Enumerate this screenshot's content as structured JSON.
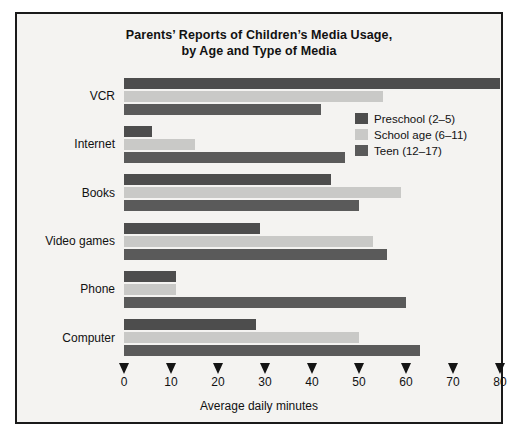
{
  "chart_data": {
    "type": "bar",
    "orientation": "horizontal",
    "title": "Parents’ Reports of Children’s Media Usage,",
    "title_line2": "by Age and Type of Media",
    "xlabel": "Average daily minutes",
    "ylabel": "",
    "xlim": [
      0,
      80
    ],
    "xticks": [
      0,
      10,
      20,
      30,
      40,
      50,
      60,
      70,
      80
    ],
    "xtick_labels": [
      "0",
      "10",
      "20",
      "30",
      "40",
      "50",
      "60",
      "70",
      "80"
    ],
    "grid": false,
    "legend_position": "inside-right-upper",
    "categories": [
      "VCR",
      "Internet",
      "Books",
      "Video games",
      "Phone",
      "Computer"
    ],
    "series": [
      {
        "name": "Preschool (2–5)",
        "color": "#4d4d4d",
        "values": [
          80,
          6,
          44,
          29,
          11,
          28
        ]
      },
      {
        "name": "School age (6–11)",
        "color": "#c9c9c7",
        "values": [
          55,
          15,
          59,
          53,
          11,
          50
        ]
      },
      {
        "name": "Teen (12–17)",
        "color": "#5a5a5a",
        "values": [
          42,
          47,
          50,
          56,
          60,
          63
        ]
      }
    ]
  },
  "colors": {
    "frame_border": "#1a1a1a",
    "background": "#f4f3f1",
    "text": "#111111",
    "preschool": "#4d4d4d",
    "school_age": "#c9c9c7",
    "teen": "#5a5a5a"
  }
}
